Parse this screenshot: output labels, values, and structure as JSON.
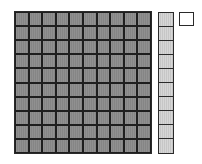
{
  "diagram": {
    "type": "base-ten-blocks",
    "blocks": [
      {
        "name": "hundred-flat",
        "rows": 10,
        "cols": 10,
        "value": 100,
        "fill": "#8a8a8a"
      },
      {
        "name": "ten-rod",
        "rows": 10,
        "cols": 1,
        "value": 10,
        "fill": "#cfcfcf"
      },
      {
        "name": "unit-cube",
        "rows": 1,
        "cols": 1,
        "value": 1,
        "fill": "#ffffff"
      }
    ],
    "outline_color": "#2a2a2a"
  }
}
